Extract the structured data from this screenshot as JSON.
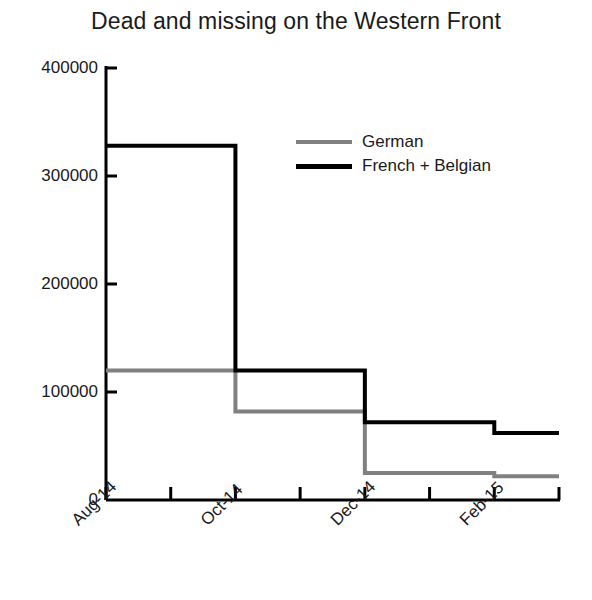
{
  "chart_data": {
    "type": "line",
    "subtype": "step",
    "title": "Dead and missing on the Western Front",
    "xlabel": "",
    "ylabel": "",
    "grid": false,
    "legend_position": "inside-top-right",
    "x": [
      "Aug-14",
      "Sep-14",
      "Oct-14",
      "Nov-14",
      "Dec-14",
      "Jan-15",
      "Feb-15",
      "Mar-15"
    ],
    "x_tick_labels": [
      "Aug-14",
      "",
      "Oct-14",
      "",
      "Dec-14",
      "",
      "Feb-15",
      ""
    ],
    "x_tick_count": 8,
    "y_tick_labels": [
      "0",
      "100000",
      "200000",
      "300000",
      "400000"
    ],
    "y_ticks": [
      0,
      100000,
      200000,
      300000,
      400000
    ],
    "ylim": [
      0,
      400000
    ],
    "series": [
      {
        "name": "German",
        "color": "#808080",
        "values": [
          120000,
          120000,
          82000,
          82000,
          25000,
          25000,
          22000,
          22000
        ]
      },
      {
        "name": "French + Belgian",
        "color": "#000000",
        "values": [
          328000,
          328000,
          120000,
          120000,
          72000,
          72000,
          62000,
          62000
        ]
      }
    ]
  },
  "legend": {
    "items": [
      {
        "label": "German",
        "color": "#808080"
      },
      {
        "label": "French + Belgian",
        "color": "#000000"
      }
    ]
  },
  "axes": {
    "axis_color": "#000000",
    "y_max_label": "400000",
    "y_min_label": "0"
  }
}
